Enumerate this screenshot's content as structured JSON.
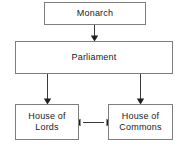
{
  "diagram": {
    "background_color": "#ffffff",
    "box_border_color": "#7d7d7d",
    "arrow_color": "#1f1f1f",
    "text_color": "#1a1a1a",
    "nodes": [
      {
        "id": "monarch",
        "label": "Monarch"
      },
      {
        "id": "parliament",
        "label": "Parliament"
      },
      {
        "id": "lords",
        "label": "House of\nLords"
      },
      {
        "id": "commons",
        "label": "House of\nCommons"
      }
    ],
    "edges": [
      {
        "id": "monarch-to-parliament",
        "from": "monarch",
        "to": "parliament",
        "direction": "down",
        "arrowheads": 1
      },
      {
        "id": "parliament-to-lords",
        "from": "parliament",
        "to": "lords",
        "direction": "down",
        "arrowheads": 1
      },
      {
        "id": "parliament-to-commons",
        "from": "parliament",
        "to": "commons",
        "direction": "down",
        "arrowheads": 1
      },
      {
        "id": "lords-to-commons",
        "from": "lords",
        "to": "commons",
        "direction": "bidirectional",
        "arrowheads": 2
      }
    ]
  }
}
